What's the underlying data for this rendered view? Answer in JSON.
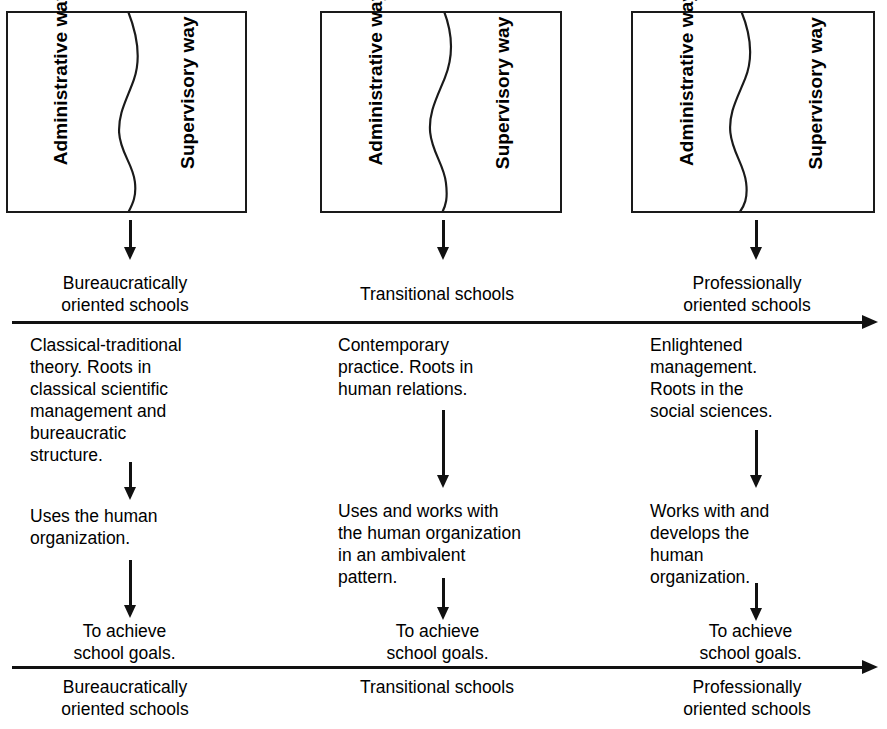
{
  "diagram": {
    "box_labels": {
      "administrative": "Administrative way",
      "supervisory": "Supervisory way"
    },
    "boxes": [
      {
        "id": "box-left",
        "administrative": "Administrative way",
        "supervisory": "Supervisory way"
      },
      {
        "id": "box-middle",
        "administrative": "Administrative way",
        "supervisory": "Supervisory way"
      },
      {
        "id": "box-right",
        "administrative": "Administrative way",
        "supervisory": "Supervisory way"
      }
    ],
    "columns": [
      {
        "id": "column-bureaucratic",
        "top_school_label": "Bureaucratically\noriented schools",
        "roots": "Classical-traditional\ntheory. Roots in\nclassical scientific\nmanagement and\nbureaucratic\nstructure.",
        "action": "Uses the human\norganization.",
        "outcome": "To achieve\nschool goals.",
        "bottom_school_label": "Bureaucratically\noriented schools"
      },
      {
        "id": "column-transitional",
        "top_school_label": "Transitional schools",
        "roots": "Contemporary\npractice. Roots in\nhuman relations.",
        "action": "Uses and works with\nthe human organization\nin an ambivalent\npattern.",
        "outcome": "To achieve\nschool goals.",
        "bottom_school_label": "Transitional schools"
      },
      {
        "id": "column-professional",
        "top_school_label": "Professionally\noriented schools",
        "roots": "Enlightened\nmanagement.\nRoots in the\nsocial sciences.",
        "action": "Works with and\ndevelops the\nhuman\norganization.",
        "outcome": "To achieve\nschool goals.",
        "bottom_school_label": "Professionally\noriented schools"
      }
    ],
    "colors": {
      "ink": "#111111",
      "background": "#ffffff"
    }
  }
}
